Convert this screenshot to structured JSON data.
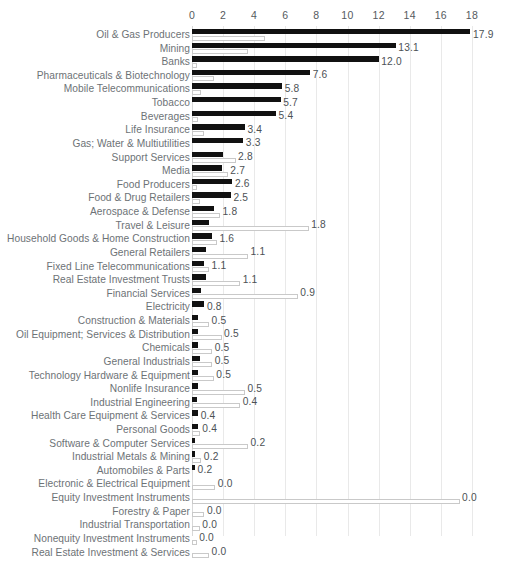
{
  "chart_data": {
    "type": "bar",
    "orientation": "horizontal",
    "title": "",
    "subtitle": "",
    "xlabel": "",
    "ylabel": "",
    "xlim": [
      0,
      18
    ],
    "xticks": [
      0,
      2,
      4,
      6,
      8,
      10,
      12,
      14,
      16,
      18
    ],
    "xtick_labels": [
      "0",
      "2",
      "4",
      "6",
      "8",
      "10",
      "12",
      "14",
      "16",
      "18"
    ],
    "grid": true,
    "grid_axis": "x",
    "legend": null,
    "legend_position": "none",
    "colors": {
      "series_primary": "#111111",
      "series_secondary_fill": "#ffffff",
      "series_secondary_edge": "#c9c9c9",
      "gridline": "#e9e9e9",
      "category_label": "#6d7276",
      "value_label": "#4c5155",
      "tick_label": "#555a5e",
      "background": "#ffffff"
    },
    "categories": [
      "Oil & Gas Producers",
      "Mining",
      "Banks",
      "Pharmaceuticals & Biotechnology",
      "Mobile Telecommunications",
      "Tobacco",
      "Beverages",
      "Life Insurance",
      "Gas; Water & Multiutilities",
      "Support Services",
      "Media",
      "Food Producers",
      "Food & Drug Retailers",
      "Aerospace & Defense",
      "Travel & Leisure",
      "Household Goods & Home Construction",
      "General Retailers",
      "Fixed Line Telecommunications",
      "Real Estate Investment Trusts",
      "Financial Services",
      "Electricity",
      "Construction & Materials",
      "Oil Equipment; Services & Distribution",
      "Chemicals",
      "General Industrials",
      "Technology Hardware & Equipment",
      "Nonlife Insurance",
      "Industrial Engineering",
      "Health Care Equipment & Services",
      "Personal Goods",
      "Software & Computer Services",
      "Industrial Metals & Mining",
      "Automobiles & Parts",
      "Electronic & Electrical Equipment",
      "Equity Investment Instruments",
      "Forestry & Paper",
      "Industrial Transportation",
      "Nonequity Investment Instruments",
      "Real Estate Investment & Services"
    ],
    "series": [
      {
        "name": "primary",
        "style": "filled-dark",
        "values": [
          17.9,
          13.1,
          12.0,
          7.6,
          5.8,
          5.7,
          5.4,
          3.4,
          3.3,
          2.0,
          1.9,
          2.6,
          2.5,
          1.4,
          1.1,
          1.3,
          0.9,
          0.8,
          0.9,
          0.6,
          0.8,
          0.4,
          0.4,
          0.4,
          0.5,
          0.4,
          0.4,
          0.3,
          0.4,
          0.4,
          0.2,
          0.2,
          0.2,
          0.0,
          0.0,
          0.0,
          0.0,
          0.0,
          0.0
        ]
      },
      {
        "name": "secondary",
        "style": "outlined-light",
        "values": [
          4.7,
          3.6,
          0.3,
          1.4,
          0.6,
          0.0,
          0.4,
          0.8,
          0.0,
          2.8,
          2.3,
          0.3,
          0.5,
          1.8,
          7.5,
          1.6,
          3.6,
          1.1,
          3.1,
          6.8,
          0.0,
          1.1,
          1.9,
          1.3,
          1.3,
          1.4,
          3.4,
          3.1,
          0.0,
          0.5,
          3.6,
          0.6,
          0.0,
          1.5,
          17.2,
          0.8,
          0.5,
          0.3,
          1.1
        ]
      }
    ],
    "value_labels": [
      "17.9",
      "13.1",
      "12.0",
      "7.6",
      "5.8",
      "5.7",
      "5.4",
      "3.4",
      "3.3",
      "2.8",
      "2.7",
      "2.6",
      "2.5",
      "1.8",
      "1.8",
      "1.6",
      "1.1",
      "1.1",
      "1.1",
      "0.9",
      "0.8",
      "0.5",
      "0.5",
      "0.5",
      "0.5",
      "0.5",
      "0.5",
      "0.4",
      "0.4",
      "0.4",
      "0.2",
      "0.2",
      "0.2",
      "0.0",
      "0.0",
      "0.0",
      "0.0",
      "0.0",
      "0.0"
    ]
  }
}
